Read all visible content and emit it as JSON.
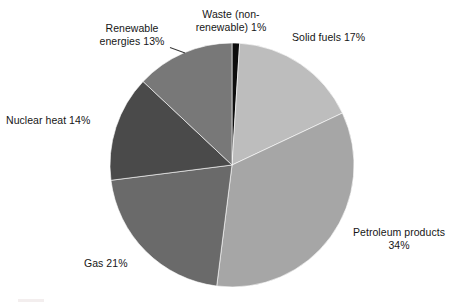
{
  "background_color": "#ffffff",
  "text_color": "#161616",
  "chart_data": {
    "type": "pie",
    "title": "",
    "subtitle": "",
    "xlabel": "",
    "ylabel": "",
    "grid": false,
    "legend_position": "none",
    "labels_position": "outside-callout",
    "start_angle_deg": 0,
    "direction": "clockwise",
    "units": "percent",
    "total": 100,
    "categories": [
      "Waste (non-renewable)",
      "Solid fuels",
      "Petroleum products",
      "Gas",
      "Nuclear heat",
      "Renewable energies"
    ],
    "values": [
      1,
      17,
      34,
      21,
      14,
      13
    ],
    "colors": [
      "#0d0d0d",
      "#bdbdbd",
      "#a6a6a6",
      "#6a6a6a",
      "#4a4a4a",
      "#787878"
    ],
    "slices": [
      {
        "name": "Waste (non-renewable)",
        "value": 1,
        "percent_text": "1%",
        "label_text": "Waste (non-\nrenewable) 1%",
        "color": "#0d0d0d",
        "start_deg": 0,
        "end_deg": 3.6
      },
      {
        "name": "Solid fuels",
        "value": 17,
        "percent_text": "17%",
        "label_text": "Solid fuels 17%",
        "color": "#bdbdbd",
        "start_deg": 3.6,
        "end_deg": 64.8
      },
      {
        "name": "Petroleum products",
        "value": 34,
        "percent_text": "34%",
        "label_text": "Petroleum products\n34%",
        "color": "#a6a6a6",
        "start_deg": 64.8,
        "end_deg": 187.2
      },
      {
        "name": "Gas",
        "value": 21,
        "percent_text": "21%",
        "label_text": "Gas 21%",
        "color": "#6a6a6a",
        "start_deg": 187.2,
        "end_deg": 262.8
      },
      {
        "name": "Nuclear heat",
        "value": 14,
        "percent_text": "14%",
        "label_text": "Nuclear heat 14%",
        "color": "#4a4a4a",
        "start_deg": 262.8,
        "end_deg": 313.2
      },
      {
        "name": "Renewable energies",
        "value": 13,
        "percent_text": "13%",
        "label_text": "Renewable\nenergies 13%",
        "color": "#787878",
        "start_deg": 313.2,
        "end_deg": 360
      }
    ],
    "geometry": {
      "center_x": 232,
      "center_y": 165,
      "radius": 122
    }
  }
}
